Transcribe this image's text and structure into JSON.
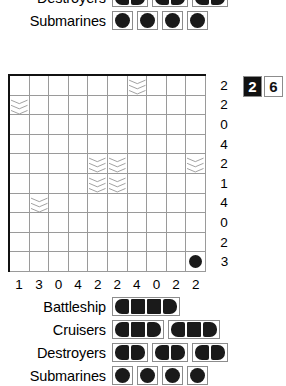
{
  "puzzle": {
    "number": "26",
    "number_digits": [
      "2",
      "6"
    ],
    "grid_size": 10,
    "row_clues": [
      2,
      2,
      0,
      4,
      2,
      1,
      4,
      0,
      2,
      3
    ],
    "column_clues": [
      1,
      3,
      0,
      4,
      2,
      2,
      4,
      0,
      2,
      2
    ],
    "water_cells": [
      {
        "row": 1,
        "col": 7
      },
      {
        "row": 2,
        "col": 1
      },
      {
        "row": 5,
        "col": 5
      },
      {
        "row": 5,
        "col": 6
      },
      {
        "row": 5,
        "col": 10
      },
      {
        "row": 6,
        "col": 5
      },
      {
        "row": 6,
        "col": 6
      },
      {
        "row": 7,
        "col": 2
      }
    ],
    "ship_cells": [
      {
        "row": 10,
        "col": 10,
        "kind": "submarine"
      }
    ]
  },
  "top_fleet": {
    "rows": [
      {
        "label": "Destroyers",
        "ships": [
          {
            "length": 2,
            "orientation": "horizontal"
          },
          {
            "length": 2,
            "orientation": "horizontal"
          },
          {
            "length": 2,
            "orientation": "horizontal"
          }
        ]
      },
      {
        "label": "Submarines",
        "ships": [
          {
            "length": 1,
            "orientation": "single"
          },
          {
            "length": 1,
            "orientation": "single"
          },
          {
            "length": 1,
            "orientation": "single"
          },
          {
            "length": 1,
            "orientation": "single"
          }
        ]
      }
    ]
  },
  "bottom_fleet": {
    "rows": [
      {
        "label": "Battleship",
        "ships": [
          {
            "length": 4,
            "orientation": "horizontal"
          }
        ]
      },
      {
        "label": "Cruisers",
        "ships": [
          {
            "length": 3,
            "orientation": "horizontal"
          },
          {
            "length": 3,
            "orientation": "horizontal"
          }
        ]
      },
      {
        "label": "Destroyers",
        "ships": [
          {
            "length": 2,
            "orientation": "horizontal"
          },
          {
            "length": 2,
            "orientation": "horizontal"
          },
          {
            "length": 2,
            "orientation": "horizontal"
          }
        ]
      },
      {
        "label": "Submarines",
        "ships": [
          {
            "length": 1,
            "orientation": "single"
          },
          {
            "length": 1,
            "orientation": "single"
          },
          {
            "length": 1,
            "orientation": "single"
          },
          {
            "length": 1,
            "orientation": "single"
          }
        ]
      }
    ]
  },
  "colors": {
    "ship_fill": "#1a1a1a",
    "grid_line": "#9a9a9a",
    "grid_border": "#111111",
    "water_line": "#9a9a9a",
    "background": "#ffffff"
  }
}
